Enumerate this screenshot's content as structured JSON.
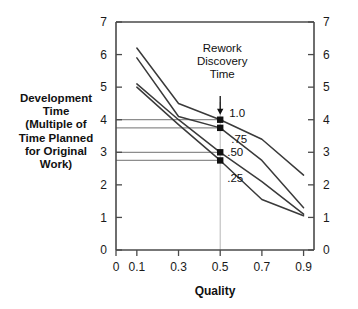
{
  "chart_data": {
    "type": "line",
    "title": "",
    "xlabel": "Quality",
    "ylabel": "Development Time (Multiple of Time Planned for Original Work)",
    "ylabel_lines": [
      "Development",
      "Time",
      "(Multiple of",
      "Time Planned",
      "for Original",
      "Work)"
    ],
    "xlim": [
      0,
      0.95
    ],
    "ylim": [
      0,
      7
    ],
    "xticks": [
      0,
      0.1,
      0.3,
      0.5,
      0.7,
      0.9
    ],
    "xticklabels": [
      "0",
      "0.1",
      "0.3",
      "0.5",
      "0.7",
      "0.9"
    ],
    "yticks": [
      0,
      1,
      2,
      3,
      4,
      5,
      6,
      7
    ],
    "yticklabels": [
      "0",
      "1",
      "2",
      "3",
      "4",
      "5",
      "6",
      "7"
    ],
    "yticklabels_right": [
      "0",
      "1",
      "2",
      "3",
      "4",
      "5",
      "6",
      "7"
    ],
    "grid": false,
    "legend": "inline-curve-labels",
    "series": [
      {
        "name": "1.0",
        "label": "1.0",
        "x": [
          0.1,
          0.3,
          0.5,
          0.7,
          0.9
        ],
        "values": [
          6.2,
          4.5,
          4.0,
          3.4,
          2.3
        ]
      },
      {
        "name": ".75",
        "label": ".75",
        "x": [
          0.1,
          0.3,
          0.5,
          0.7,
          0.9
        ],
        "values": [
          5.9,
          4.1,
          3.75,
          2.75,
          1.3
        ]
      },
      {
        "name": ".50",
        "label": ".50",
        "x": [
          0.1,
          0.3,
          0.5,
          0.7,
          0.9
        ],
        "values": [
          5.1,
          4.0,
          3.0,
          2.1,
          1.1
        ]
      },
      {
        "name": ".25",
        "label": ".25",
        "x": [
          0.1,
          0.3,
          0.5,
          0.7,
          0.9
        ],
        "values": [
          5.0,
          3.85,
          2.75,
          1.55,
          1.05
        ]
      }
    ],
    "markers": [
      {
        "x": 0.5,
        "y": 4.0,
        "series": "1.0"
      },
      {
        "x": 0.5,
        "y": 3.75,
        "series": ".75"
      },
      {
        "x": 0.5,
        "y": 3.0,
        "series": ".50"
      },
      {
        "x": 0.5,
        "y": 2.75,
        "series": ".25"
      }
    ],
    "reference_lines": {
      "vertical_x": 0.5,
      "horizontal_y": [
        4.0,
        3.75,
        3.0,
        2.75
      ]
    },
    "annotations": [
      {
        "text_lines": [
          "Rework",
          "Discovery",
          "Time"
        ],
        "arrow_to": {
          "x": 0.5,
          "y": 4.0
        }
      }
    ]
  },
  "labels": {
    "annotation_line1": "Rework",
    "annotation_line2": "Discovery",
    "annotation_line3": "Time",
    "curve_1": "1.0",
    "curve_2": ".75",
    "curve_3": ".50",
    "curve_4": ".25",
    "x_axis_title": "Quality"
  }
}
